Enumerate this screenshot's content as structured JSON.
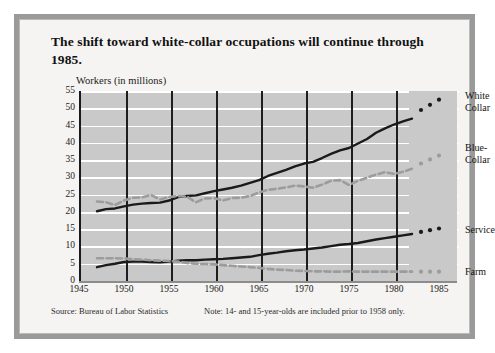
{
  "title": "The shift toward white-collar occupations will continue through 1985.",
  "chart_data": {
    "type": "line",
    "title": "The shift toward white-collar occupations will continue through 1985.",
    "ylabel": "Workers (in millions)",
    "xlabel": "",
    "xlim": [
      1945,
      1987
    ],
    "ylim": [
      0,
      55
    ],
    "grid": true,
    "legend_position": "right-inline",
    "yticks": [
      0,
      5,
      10,
      15,
      20,
      25,
      30,
      35,
      40,
      45,
      50,
      55
    ],
    "xticks": [
      1945,
      1950,
      1955,
      1960,
      1965,
      1970,
      1975,
      1980,
      1985
    ],
    "series": [
      {
        "name": "White Collar",
        "label": "White\nCollar",
        "style": "solid",
        "color": "#1a1a1a",
        "x": [
          1947,
          1948,
          1949,
          1950,
          1951,
          1952,
          1953,
          1954,
          1955,
          1956,
          1957,
          1958,
          1959,
          1960,
          1961,
          1962,
          1963,
          1964,
          1965,
          1966,
          1967,
          1968,
          1969,
          1970,
          1971,
          1972,
          1973,
          1974,
          1975,
          1976,
          1977,
          1978,
          1979,
          1980,
          1981,
          1982
        ],
        "values": [
          20.2,
          20.8,
          21.0,
          21.6,
          22.1,
          22.4,
          22.6,
          22.7,
          23.3,
          24.3,
          24.6,
          24.8,
          25.4,
          26.0,
          26.5,
          27.0,
          27.6,
          28.4,
          29.2,
          30.4,
          31.3,
          32.2,
          33.2,
          34.0,
          34.5,
          35.6,
          36.8,
          37.8,
          38.5,
          39.8,
          41.1,
          42.9,
          44.2,
          45.3,
          46.2,
          47.0
        ]
      },
      {
        "name": "Blue-Collar",
        "label": "Blue-\nCollar",
        "style": "dashed",
        "color": "#9c9c9c",
        "x": [
          1947,
          1948,
          1949,
          1950,
          1951,
          1952,
          1953,
          1954,
          1955,
          1956,
          1957,
          1958,
          1959,
          1960,
          1961,
          1962,
          1963,
          1964,
          1965,
          1966,
          1967,
          1968,
          1969,
          1970,
          1971,
          1972,
          1973,
          1974,
          1975,
          1976,
          1977,
          1978,
          1979,
          1980,
          1981,
          1982
        ],
        "values": [
          23.0,
          22.8,
          22.0,
          23.3,
          24.1,
          24.2,
          24.9,
          23.6,
          24.3,
          24.6,
          24.4,
          22.8,
          23.9,
          24.0,
          23.3,
          24.0,
          24.1,
          24.6,
          25.6,
          26.4,
          26.7,
          27.1,
          27.6,
          27.4,
          27.0,
          27.9,
          29.0,
          29.2,
          27.8,
          29.0,
          29.9,
          30.8,
          31.5,
          31.0,
          31.6,
          32.5
        ]
      },
      {
        "name": "Service",
        "label": "Service",
        "style": "solid",
        "color": "#1a1a1a",
        "x": [
          1947,
          1948,
          1949,
          1950,
          1951,
          1952,
          1953,
          1954,
          1955,
          1956,
          1957,
          1958,
          1959,
          1960,
          1961,
          1962,
          1963,
          1964,
          1965,
          1966,
          1967,
          1968,
          1969,
          1970,
          1971,
          1972,
          1973,
          1974,
          1975,
          1976,
          1977,
          1978,
          1979,
          1980,
          1981,
          1982
        ],
        "values": [
          4.0,
          4.6,
          5.0,
          5.5,
          5.6,
          5.6,
          5.5,
          5.4,
          5.6,
          5.9,
          6.0,
          6.0,
          6.2,
          6.3,
          6.4,
          6.6,
          6.8,
          7.0,
          7.5,
          7.9,
          8.2,
          8.6,
          8.9,
          9.1,
          9.4,
          9.7,
          10.1,
          10.5,
          10.7,
          11.0,
          11.5,
          12.0,
          12.4,
          12.8,
          13.2,
          13.6
        ]
      },
      {
        "name": "Farm",
        "label": "Farm",
        "style": "dashed",
        "color": "#9c9c9c",
        "x": [
          1947,
          1948,
          1949,
          1950,
          1951,
          1952,
          1953,
          1954,
          1955,
          1956,
          1957,
          1958,
          1959,
          1960,
          1961,
          1962,
          1963,
          1964,
          1965,
          1966,
          1967,
          1968,
          1969,
          1970,
          1971,
          1972,
          1973,
          1974,
          1975,
          1976,
          1977,
          1978,
          1979,
          1980,
          1981,
          1982
        ],
        "values": [
          6.6,
          6.6,
          6.6,
          6.5,
          6.3,
          6.2,
          6.0,
          5.9,
          5.8,
          5.6,
          5.2,
          5.0,
          4.9,
          4.8,
          4.6,
          4.4,
          4.2,
          4.0,
          3.8,
          3.5,
          3.3,
          3.2,
          3.0,
          2.9,
          2.8,
          2.8,
          2.7,
          2.7,
          2.8,
          2.7,
          2.7,
          2.7,
          2.7,
          2.7,
          2.7,
          2.7
        ]
      }
    ],
    "projections": [
      {
        "name": "White Collar",
        "x": [
          1983,
          1984,
          1985
        ],
        "values": [
          49.5,
          51.0,
          52.5
        ],
        "color": "#1a1a1a"
      },
      {
        "name": "Blue-Collar",
        "x": [
          1983,
          1984,
          1985
        ],
        "values": [
          34.0,
          35.2,
          36.3
        ],
        "color": "#9c9c9c"
      },
      {
        "name": "Service",
        "x": [
          1983,
          1984,
          1985
        ],
        "values": [
          14.2,
          14.7,
          15.2
        ],
        "color": "#1a1a1a"
      },
      {
        "name": "Farm",
        "x": [
          1983,
          1984,
          1985
        ],
        "values": [
          2.7,
          2.7,
          2.7
        ],
        "color": "#9c9c9c"
      }
    ]
  },
  "footer": {
    "source": "Source: Bureau of Labor Statistics",
    "note": "Note: 14- and 15-year-olds are included prior to 1958 only."
  },
  "colors": {
    "frame": "#9a9a9a",
    "plot_background": "#c9c9c9",
    "gridline": "#ffffff",
    "solid_series": "#1a1a1a",
    "dashed_series": "#9c9c9c",
    "page_background": "#f5f4f2"
  }
}
